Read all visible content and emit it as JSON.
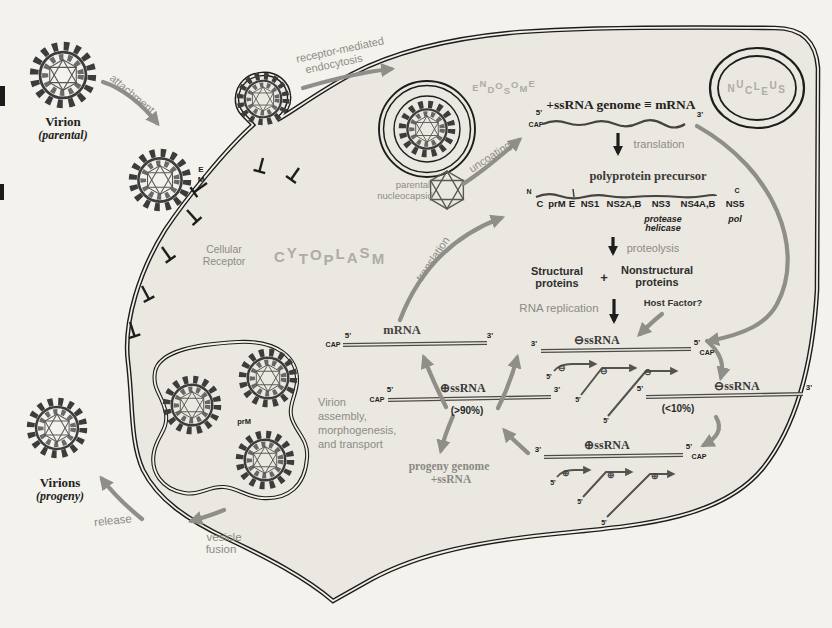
{
  "colors": {
    "bg": "#f4f2ec",
    "cell": "#eae8e0",
    "ink": "#1d1d1d",
    "arrow": "#908e89",
    "graytext": "#8d8b86",
    "faded": "#aeaca6",
    "rna": "#4d4b48",
    "darktext": "#222222"
  },
  "ends": {
    "five": "5'",
    "three": "3'",
    "cap": "CAP",
    "n": "N",
    "c": "C"
  },
  "entry": {
    "virion_title": "Virion",
    "virion_sub": "(parental)",
    "attachment": "attachment",
    "endocytosis_1": "receptor-mediated",
    "endocytosis_2": "endocytosis",
    "e": "E",
    "m": "M",
    "receptor_1": "Cellular",
    "receptor_2": "Receptor"
  },
  "compartments": {
    "cytoplasm": "CYTOPLASM",
    "endosome": "ENDOSOME",
    "nucleus": "NUCLEUS"
  },
  "uncoating": {
    "label": "uncoating",
    "capsid_1": "parental",
    "capsid_2": "nucleocapsid"
  },
  "genome": {
    "title": "+ssRNA genome ≡ mRNA"
  },
  "translation": {
    "down_label": "translation",
    "curve_label": "translation"
  },
  "polyprotein": {
    "title": "polyprotein precursor",
    "segments": [
      "C",
      "prM",
      "E",
      "NS1",
      "NS2A,B",
      "NS3",
      "NS4A,B",
      "NS5"
    ],
    "ns3_1": "protease",
    "ns3_2": "helicase",
    "ns5": "pol"
  },
  "processing": {
    "proteolysis": "proteolysis",
    "structural_1": "Structural",
    "structural_2": "proteins",
    "plus": "+",
    "nonstructural_1": "Nonstructural",
    "nonstructural_2": "proteins"
  },
  "replication": {
    "label": "RNA replication",
    "host_factor": "Host Factor?",
    "mrna": "mRNA",
    "plus_label": "⊕ssRNA",
    "plus_pct": "(>90%)",
    "minus_label": "⊖ssRNA",
    "minus_pct": "(<10%)",
    "ri_top_label": "⊖ssRNA",
    "ri_top_symbol": "⊖",
    "ri_bottom_label": "⊕ssRNA",
    "ri_bottom_symbol": "⊕",
    "progeny_1": "progeny genome",
    "progeny_2": "+ssRNA"
  },
  "assembly": {
    "line_1": "Virion",
    "line_2": "assembly,",
    "line_3": "morphogenesis,",
    "line_4": "and transport",
    "prm": "prM"
  },
  "egress": {
    "virions_title": "Virions",
    "virions_sub": "(progeny)",
    "release": "release",
    "fusion_1": "vesicle",
    "fusion_2": "fusion"
  }
}
